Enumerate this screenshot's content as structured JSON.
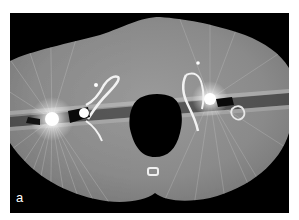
{
  "figure": {
    "panel_label": "a",
    "colors": {
      "background": "#000000",
      "soft_tissue": "#8c8c8c",
      "bone": "#f2f2f2",
      "metal": "#ffffff",
      "page": "#ffffff"
    }
  }
}
